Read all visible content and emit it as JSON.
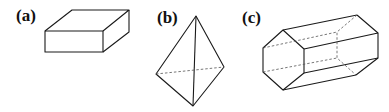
{
  "figure": {
    "panels": [
      {
        "label": "(a)",
        "shape": "rectangular-box"
      },
      {
        "label": "(b)",
        "shape": "tetrahedron"
      },
      {
        "label": "(c)",
        "shape": "hexagonal-prism"
      }
    ]
  }
}
